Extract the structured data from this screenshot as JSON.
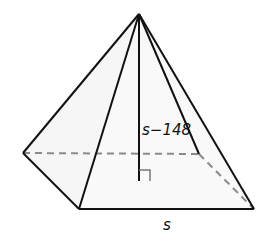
{
  "figure": {
    "type": "square pyramid",
    "labels": {
      "height": "s−148",
      "base_side": "s"
    },
    "colors": {
      "edge": "#111111",
      "hidden_edge": "#8a8a8a",
      "face": "#f7f7f7",
      "background": "#ffffff"
    }
  }
}
